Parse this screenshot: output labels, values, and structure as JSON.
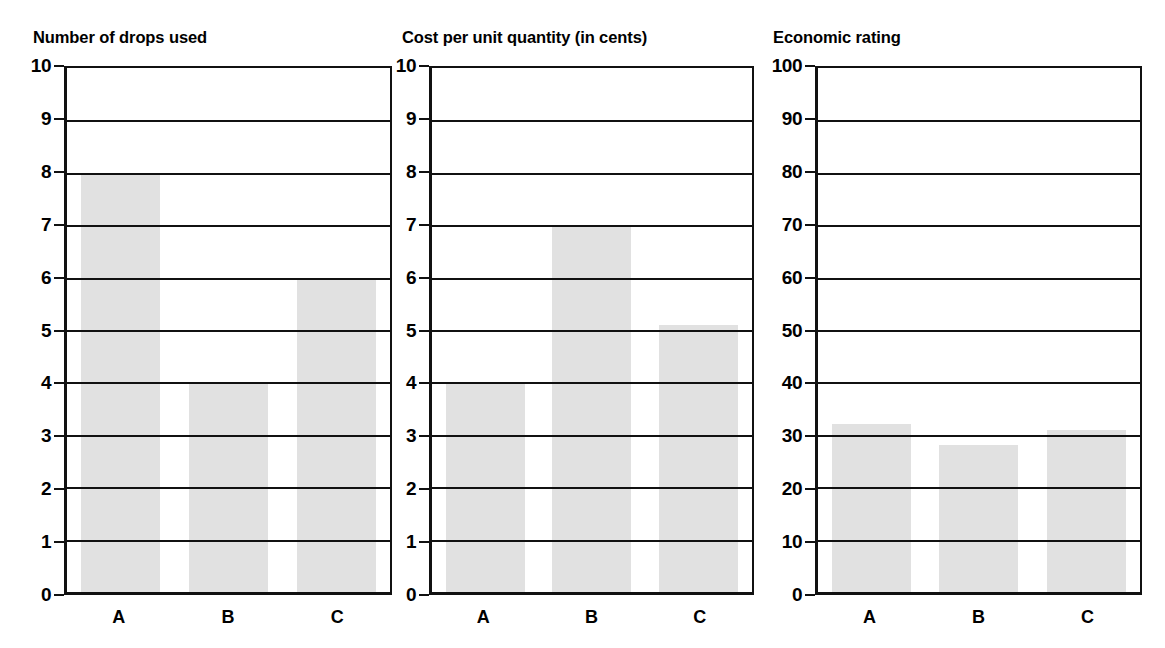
{
  "figure": {
    "background": "#ffffff",
    "bar_color": "#e1e1e1",
    "axis_color": "#111111"
  },
  "chart_data": [
    {
      "type": "bar",
      "title": "Number of drops used",
      "xlabel": "",
      "ylabel": "",
      "categories": [
        "A",
        "B",
        "C"
      ],
      "values": [
        8,
        4,
        6
      ],
      "ylim": [
        0,
        10
      ],
      "yticks": [
        0,
        1,
        2,
        3,
        4,
        5,
        6,
        7,
        8,
        9,
        10
      ],
      "ytick_labels": [
        "0",
        "1",
        "2",
        "3",
        "4",
        "5",
        "6",
        "7",
        "8",
        "9",
        "10"
      ],
      "grid": true,
      "legend": null
    },
    {
      "type": "bar",
      "title": "Cost per unit quantity (in cents)",
      "xlabel": "",
      "ylabel": "",
      "categories": [
        "A",
        "B",
        "C"
      ],
      "values": [
        4,
        7,
        5.1
      ],
      "ylim": [
        0,
        10
      ],
      "yticks": [
        0,
        1,
        2,
        3,
        4,
        5,
        6,
        7,
        8,
        9,
        10
      ],
      "ytick_labels": [
        "0",
        "1",
        "2",
        "3",
        "4",
        "5",
        "6",
        "7",
        "8",
        "9",
        "10"
      ],
      "grid": true,
      "legend": null
    },
    {
      "type": "bar",
      "title": "Economic rating",
      "xlabel": "",
      "ylabel": "",
      "categories": [
        "A",
        "B",
        "C"
      ],
      "values": [
        32,
        28,
        31
      ],
      "ylim": [
        0,
        100
      ],
      "yticks": [
        0,
        10,
        20,
        30,
        40,
        50,
        60,
        70,
        80,
        90,
        100
      ],
      "ytick_labels": [
        "0",
        "10",
        "20",
        "30",
        "40",
        "50",
        "60",
        "70",
        "80",
        "90",
        "100"
      ],
      "grid": true,
      "legend": null
    }
  ]
}
